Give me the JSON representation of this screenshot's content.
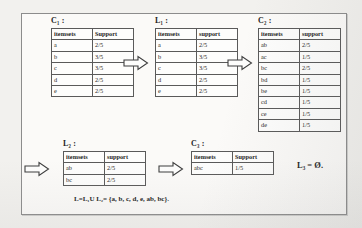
{
  "diagram": {
    "title_label_c1": "C₁ :",
    "title_label_l1": "L₁ :",
    "title_label_c2": "C₂ :",
    "title_label_l2": "L₂ :",
    "title_label_c3": "C₃ :",
    "empty_result": "L₃ = Ø.",
    "union_formula": "L=L₁U L₂= {a, b, c, d, e, ab, bc}.",
    "arrow_icon": "right-block-arrow"
  },
  "tables": {
    "c1": {
      "name": "C1",
      "headers": [
        "itemsets",
        "Support"
      ],
      "rows": [
        [
          "a",
          "2/5"
        ],
        [
          "b",
          "3/5"
        ],
        [
          "c",
          "3/5"
        ],
        [
          "d",
          "2/5"
        ],
        [
          "e",
          "2/5"
        ]
      ]
    },
    "l1": {
      "name": "L1",
      "headers": [
        "itemsets",
        "support"
      ],
      "rows": [
        [
          "a",
          "2/5"
        ],
        [
          "b",
          "3/5"
        ],
        [
          "c",
          "3/5"
        ],
        [
          "d",
          "2/5"
        ],
        [
          "e",
          "2/5"
        ]
      ]
    },
    "c2": {
      "name": "C2",
      "headers": [
        "itemsets",
        "support"
      ],
      "rows": [
        [
          "ab",
          "2/5"
        ],
        [
          "ac",
          "1/5"
        ],
        [
          "bc",
          "2/5"
        ],
        [
          "bd",
          "1/5"
        ],
        [
          "be",
          "1/5"
        ],
        [
          "cd",
          "1/5"
        ],
        [
          "ce",
          "1/5"
        ],
        [
          "de",
          "1/5"
        ]
      ]
    },
    "l2": {
      "name": "L2",
      "headers": [
        "itemsets",
        "support"
      ],
      "rows": [
        [
          "ab",
          "2/5"
        ],
        [
          "bc",
          "2/5"
        ]
      ]
    },
    "c3": {
      "name": "C3",
      "headers": [
        "itemsets",
        "Support"
      ],
      "rows": [
        [
          "abc",
          "1/5"
        ]
      ]
    }
  }
}
